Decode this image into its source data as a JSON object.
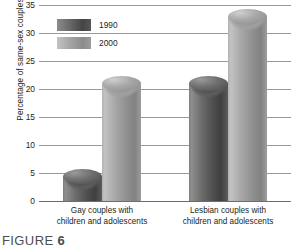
{
  "chart_data": {
    "type": "bar",
    "title": "",
    "xlabel": "",
    "ylabel": "Percentage of same-sex couples",
    "ylim": [
      0,
      35
    ],
    "yticks": [
      0,
      5,
      10,
      15,
      20,
      25,
      30,
      35
    ],
    "ytick_labels": [
      "0",
      "5",
      "10",
      "15",
      "20",
      "25",
      "30",
      "35"
    ],
    "grid": true,
    "legend_position": "upper-left-inside",
    "categories": [
      "Gay couples with children and adolescents",
      "Lesbian couples with children and adolescents"
    ],
    "category_lines": [
      [
        "Gay couples with",
        "children and adolescents"
      ],
      [
        "Lesbian couples with",
        "children and adolescents"
      ]
    ],
    "series": [
      {
        "name": "1990",
        "values": [
          4.5,
          21
        ],
        "color": "#5e5e5e"
      },
      {
        "name": "2000",
        "values": [
          21,
          33
        ],
        "color": "#a0a0a0"
      }
    ]
  },
  "legend": {
    "items": [
      {
        "label": "1990",
        "series_key": "s1990"
      },
      {
        "label": "2000",
        "series_key": "s2000"
      }
    ]
  },
  "caption": {
    "word": "FIGURE",
    "number": "6"
  }
}
